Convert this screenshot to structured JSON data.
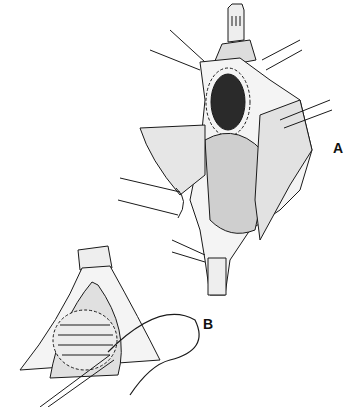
{
  "figure": {
    "type": "surgical illustration (line drawing)",
    "panels": [
      {
        "id": "A",
        "label": "A",
        "description": "Opened vessel/conduit with dark oval orifice and dashed suture line, retracted by instruments"
      },
      {
        "id": "B",
        "label": "B",
        "description": "Patch closure with interrupted sutures around oval, needle and thread in forceps"
      }
    ]
  },
  "colors": {
    "ink": "#1a1a1a",
    "background": "#ffffff"
  }
}
